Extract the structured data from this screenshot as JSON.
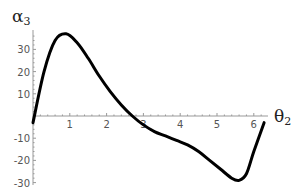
{
  "chart_data": {
    "type": "line",
    "title": "",
    "xlabel": "θ2",
    "ylabel": "α3",
    "xlim": [
      0,
      6.4
    ],
    "ylim": [
      -30,
      38
    ],
    "grid": false,
    "legend": null,
    "x_ticks": [
      1,
      2,
      3,
      4,
      5,
      6
    ],
    "y_ticks": [
      30,
      20,
      10,
      -10,
      -20,
      -30
    ],
    "series": [
      {
        "name": "α3(θ2)",
        "x": [
          0.0,
          0.3,
          0.6,
          0.9,
          1.2,
          1.5,
          1.8,
          2.1,
          2.4,
          2.7,
          3.0,
          3.3,
          3.6,
          3.9,
          4.2,
          4.5,
          4.8,
          5.1,
          5.4,
          5.6,
          5.8,
          6.0,
          6.28
        ],
        "values": [
          -3,
          20,
          34,
          37,
          33,
          26,
          18,
          11,
          5,
          0,
          -4,
          -7,
          -9,
          -11,
          -13,
          -16,
          -20,
          -24,
          -28,
          -29,
          -26,
          -16,
          -3
        ]
      }
    ]
  },
  "axes": {
    "x_label_main": "θ",
    "x_label_sub": "2",
    "y_label_main": "α",
    "y_label_sub": "3",
    "x_tick_labels": [
      "1",
      "2",
      "3",
      "4",
      "5",
      "6"
    ],
    "y_tick_labels": [
      "30",
      "20",
      "10",
      "-10",
      "-20",
      "-30"
    ]
  }
}
